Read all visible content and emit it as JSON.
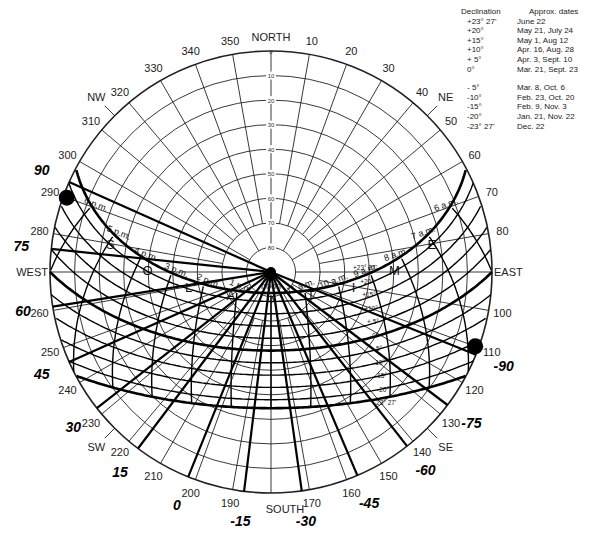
{
  "chart_data": {
    "type": "polar-sun-path-diagram",
    "title": "",
    "center": [
      271,
      272
    ],
    "radius": 221,
    "latitude_deg": 32,
    "compass_labels": [
      {
        "label": "NORTH",
        "azimuth": 0
      },
      {
        "label": "NE",
        "azimuth": 45
      },
      {
        "label": "EAST",
        "azimuth": 90
      },
      {
        "label": "SE",
        "azimuth": 135
      },
      {
        "label": "SOUTH",
        "azimuth": 180
      },
      {
        "label": "SW",
        "azimuth": 225
      },
      {
        "label": "WEST",
        "azimuth": 270
      },
      {
        "label": "NW",
        "azimuth": 315
      }
    ],
    "azimuth_ticks": [
      10,
      20,
      30,
      40,
      50,
      60,
      70,
      80,
      100,
      110,
      120,
      130,
      140,
      150,
      160,
      170,
      190,
      200,
      210,
      220,
      230,
      240,
      250,
      260,
      280,
      290,
      300,
      310,
      320,
      330,
      340,
      350
    ],
    "altitude_rings": [
      0,
      10,
      20,
      30,
      40,
      50,
      60,
      70,
      80
    ],
    "date_lines": [
      {
        "declination": "+23° 27'",
        "value": 23.45,
        "dates": "June 22"
      },
      {
        "declination": "+20°",
        "value": 20,
        "dates": "May 21, July 24"
      },
      {
        "declination": "+15°",
        "value": 15,
        "dates": "May 1, Aug 12"
      },
      {
        "declination": "+10°",
        "value": 10,
        "dates": "Apr. 16, Aug. 28"
      },
      {
        "declination": "+ 5°",
        "value": 5,
        "dates": "Apr. 3, Sept. 10"
      },
      {
        "declination": "0°",
        "value": 0,
        "dates": "Mar. 21, Sept. 23"
      },
      {
        "declination": "- 5°",
        "value": -5,
        "dates": "Mar. 8, Oct. 6"
      },
      {
        "declination": "-10°",
        "value": -10,
        "dates": "Feb. 23, Oct. 20"
      },
      {
        "declination": "-15°",
        "value": -15,
        "dates": "Feb. 9, Nov. 3"
      },
      {
        "declination": "-20°",
        "value": -20,
        "dates": "Jan. 21, Nov. 22"
      },
      {
        "declination": "-23° 27'",
        "value": -23.45,
        "dates": "Dec. 22"
      }
    ],
    "hour_labels": [
      "6 p.m.",
      "5 p.m.",
      "4 p.m.",
      "3 p.m.",
      "2 p.m.",
      "1 p.m.",
      "noon",
      "11 a.m.",
      "10 a.m.",
      "9 a.m.",
      "8 a.m.",
      "7 a.m.",
      "6 a.m."
    ],
    "solar_time_letters": [
      "S",
      "O",
      "L",
      "A",
      "R",
      "T",
      "I",
      "M",
      "E"
    ],
    "protractor_labels": [
      {
        "label": "90",
        "azimuth": 294
      },
      {
        "label": "75",
        "azimuth": 276
      },
      {
        "label": "60",
        "azimuth": 261
      },
      {
        "label": "45",
        "azimuth": 246
      },
      {
        "label": "30",
        "azimuth": 232
      },
      {
        "label": "15",
        "azimuth": 217
      },
      {
        "label": "0",
        "azimuth": 202
      },
      {
        "label": "-15",
        "azimuth": 187
      },
      {
        "label": "-30",
        "azimuth": 172
      },
      {
        "label": "-45",
        "azimuth": 157
      },
      {
        "label": "-60",
        "azimuth": 142
      },
      {
        "label": "-75",
        "azimuth": 127
      },
      {
        "label": "-90",
        "azimuth": 112
      }
    ],
    "inner_protractor_labels": [
      "75",
      "60",
      "45",
      "30",
      "15"
    ]
  },
  "legend": {
    "declination_header": "Declination",
    "dates_header": "Approx. dates",
    "rows_north": [
      {
        "d": "+23° 27'",
        "a": "June 22"
      },
      {
        "d": "+20°",
        "a": "May 21, July 24"
      },
      {
        "d": "+15°",
        "a": "May 1, Aug 12"
      },
      {
        "d": "+10°",
        "a": "Apr. 16, Aug. 28"
      },
      {
        "d": "+ 5°",
        "a": "Apr. 3, Sept. 10"
      },
      {
        "d": "0°",
        "a": "Mar. 21, Sept. 23"
      }
    ],
    "rows_south": [
      {
        "d": "- 5°",
        "a": "Mar. 8, Oct. 6"
      },
      {
        "d": "-10°",
        "a": "Feb. 23, Oct. 20"
      },
      {
        "d": "-15°",
        "a": "Feb. 9, Nov. 3"
      },
      {
        "d": "-20°",
        "a": "Jan. 21, Nov. 22"
      },
      {
        "d": "-23° 27'",
        "a": "Dec. 22"
      }
    ]
  }
}
